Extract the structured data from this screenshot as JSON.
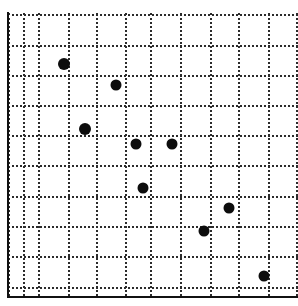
{
  "chart_data": {
    "type": "scatter",
    "title": "",
    "subtitle": "",
    "xlabel": "",
    "ylabel": "",
    "xlim": [
      0,
      9.7
    ],
    "ylim": [
      0,
      9.4
    ],
    "grid": true,
    "legend": null,
    "legend_position": "none",
    "annotations": [],
    "xticklabels": [],
    "yticklabels": [],
    "marker_color": "#0d0d0d",
    "marker_shape": "circle",
    "marker_size_px": 11,
    "series": [
      {
        "name": "series-1",
        "points": [
          {
            "x": 1.9,
            "y": 7.75
          },
          {
            "x": 3.65,
            "y": 7.05
          },
          {
            "x": 2.6,
            "y": 5.6
          },
          {
            "x": 4.3,
            "y": 5.1
          },
          {
            "x": 5.5,
            "y": 5.1
          },
          {
            "x": 4.55,
            "y": 3.6
          },
          {
            "x": 7.4,
            "y": 2.95
          },
          {
            "x": 6.55,
            "y": 2.15
          },
          {
            "x": 8.55,
            "y": 0.65
          }
        ],
        "x": [
          1.9,
          3.65,
          2.6,
          4.3,
          5.5,
          4.55,
          7.4,
          6.55,
          8.55
        ],
        "y": [
          7.75,
          7.05,
          5.6,
          5.1,
          5.1,
          3.6,
          2.95,
          2.15,
          0.65
        ]
      }
    ]
  },
  "figure": {
    "width_px": 298,
    "height_px": 306,
    "background_color": "#ffffff",
    "grid_color": "#2b2b2b",
    "axis_color": "#111111"
  },
  "geometry": {
    "plot_left_px": 7,
    "plot_bottom_px": 296,
    "cell_size_px": 30,
    "grid_origin_x_px": 8,
    "grid_origin_y_px": 287,
    "vertical_gridlines_px": [
      8,
      23,
      38,
      68,
      96,
      125,
      150,
      180,
      210,
      238,
      268,
      296
    ],
    "horizontal_gridlines_px": [
      14,
      45,
      75,
      105,
      135,
      165,
      196,
      226,
      256,
      287
    ],
    "markers_px": [
      {
        "cx": 64,
        "cy": 64,
        "d": 12
      },
      {
        "cx": 116,
        "cy": 85,
        "d": 11
      },
      {
        "cx": 85,
        "cy": 129,
        "d": 12
      },
      {
        "cx": 136,
        "cy": 144,
        "d": 11
      },
      {
        "cx": 172,
        "cy": 144,
        "d": 11
      },
      {
        "cx": 143,
        "cy": 188,
        "d": 11
      },
      {
        "cx": 229,
        "cy": 208,
        "d": 11
      },
      {
        "cx": 204,
        "cy": 231,
        "d": 11
      },
      {
        "cx": 264,
        "cy": 276,
        "d": 11
      }
    ]
  }
}
